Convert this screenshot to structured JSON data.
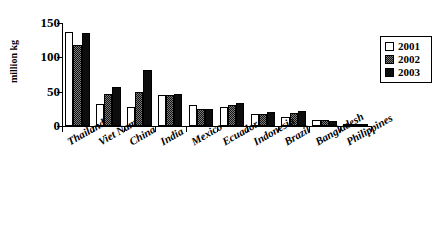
{
  "chart_data": {
    "type": "bar",
    "title": "",
    "xlabel": "",
    "ylabel": "million kg",
    "ylim": [
      0,
      150
    ],
    "yticks": [
      0,
      50,
      100,
      150
    ],
    "grid": false,
    "legend_position": "right",
    "categories": [
      "Thailand",
      "Viet Nam",
      "China",
      "India",
      "Mexico",
      "Ecuador",
      "Indonesia",
      "Brazil",
      "Bangladesh",
      "Philippines"
    ],
    "series": [
      {
        "name": "2001",
        "values": [
          137,
          32,
          28,
          45,
          31,
          28,
          17,
          13,
          9,
          2
        ]
      },
      {
        "name": "2002",
        "values": [
          118,
          46,
          50,
          45,
          25,
          31,
          18,
          19,
          9,
          2
        ]
      },
      {
        "name": "2003",
        "values": [
          135,
          57,
          81,
          46,
          25,
          33,
          21,
          22,
          8,
          2
        ]
      }
    ],
    "series_colors": [
      "#ffffff",
      "#7d7d7d",
      "#0d0d0d"
    ]
  },
  "axis": {
    "y_title": "million kg",
    "y_tick_labels": [
      "150",
      "100",
      "50",
      "0"
    ]
  },
  "legend": {
    "items": [
      {
        "label": "2001"
      },
      {
        "label": "2002"
      },
      {
        "label": "2003"
      }
    ]
  }
}
